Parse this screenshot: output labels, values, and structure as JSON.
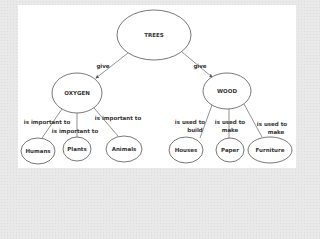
{
  "diagram": {
    "type": "concept-map",
    "nodes": {
      "trees": "TREES",
      "oxygen": "OXYGEN",
      "wood": "WOOD",
      "humans": "Humans",
      "plants": "Plants",
      "animals": "Animals",
      "houses": "Houses",
      "paper": "Paper",
      "furniture": "Furniture"
    },
    "edges": {
      "trees_oxygen": "give",
      "trees_wood": "give",
      "oxygen_humans": "is important to",
      "oxygen_plants": "is important to",
      "oxygen_animals": "is important to",
      "wood_houses_1": "is used to",
      "wood_houses_2": "build",
      "wood_paper_1": "is used to",
      "wood_paper_2": "make",
      "wood_furniture_1": "is used to",
      "wood_furniture_2": "make"
    },
    "colors": {
      "background": "#e9e9e9",
      "panel": "#ffffff",
      "stroke": "#555555",
      "text": "#333333"
    }
  }
}
